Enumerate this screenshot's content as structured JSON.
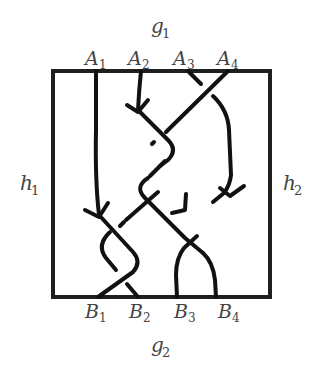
{
  "diagram": {
    "top_label": {
      "main": "g",
      "sub": "1"
    },
    "bottom_label": {
      "main": "g",
      "sub": "2"
    },
    "left_label": {
      "main": "h",
      "sub": "1"
    },
    "right_label": {
      "main": "h",
      "sub": "2"
    },
    "top_points": [
      {
        "main": "A",
        "sub": "1"
      },
      {
        "main": "A",
        "sub": "2"
      },
      {
        "main": "A",
        "sub": "3"
      },
      {
        "main": "A",
        "sub": "4"
      }
    ],
    "bottom_points": [
      {
        "main": "B",
        "sub": "1"
      },
      {
        "main": "B",
        "sub": "2"
      },
      {
        "main": "B",
        "sub": "3"
      },
      {
        "main": "B",
        "sub": "4"
      }
    ],
    "strand_count": 4,
    "arrow_count": 4,
    "colors": {
      "stroke": "#111111",
      "box": "#1f1f1f",
      "label": "#444444",
      "background": "#ffffff"
    }
  }
}
